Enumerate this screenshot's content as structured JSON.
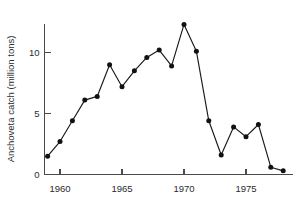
{
  "chart_data": {
    "type": "line",
    "title": "",
    "subtitle": "",
    "xlabel": "",
    "ylabel": "Anchoveta catch (million tons)",
    "x": [
      1959,
      1960,
      1961,
      1962,
      1963,
      1964,
      1965,
      1966,
      1967,
      1968,
      1969,
      1970,
      1971,
      1972,
      1973,
      1974,
      1975,
      1976,
      1977,
      1978
    ],
    "values": [
      1.5,
      2.7,
      4.4,
      6.1,
      6.4,
      9.0,
      7.2,
      8.5,
      9.6,
      10.2,
      8.9,
      12.3,
      10.1,
      4.4,
      1.6,
      3.9,
      3.1,
      4.1,
      0.6,
      0.3
    ],
    "series": [
      {
        "name": "Anchoveta catch",
        "values": [
          1.5,
          2.7,
          4.4,
          6.1,
          6.4,
          9.0,
          7.2,
          8.5,
          9.6,
          10.2,
          8.9,
          12.3,
          10.1,
          4.4,
          1.6,
          3.9,
          3.1,
          4.1,
          0.6,
          0.3
        ]
      }
    ],
    "xlim": [
      1958.6,
      1978.6
    ],
    "ylim": [
      0,
      13.2
    ],
    "xticks": [
      1960,
      1965,
      1970,
      1975
    ],
    "xtick_labels": [
      "1960",
      "1965",
      "1970",
      "1975"
    ],
    "yticks": [
      0,
      5,
      10
    ],
    "ytick_labels": [
      "0",
      "5",
      "10"
    ],
    "grid": false,
    "legend": false,
    "legend_position": "none",
    "marker": "filled-circle",
    "line_color": "#1a1a1a",
    "marker_color": "#111111",
    "axis_color": "#4a4a4a",
    "background_color": "#ffffff"
  }
}
